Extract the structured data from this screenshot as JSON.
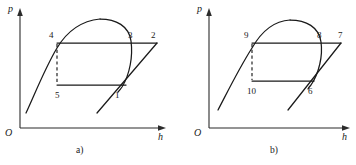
{
  "figure": {
    "type": "thermodynamic-cycle-p-h-diagram-pair",
    "background_color": "#ffffff",
    "line_color": "#1a1a1a",
    "axis_color": "#2b2b2b",
    "width": 356,
    "height": 165
  },
  "panels": [
    {
      "id": "a",
      "caption": "a)",
      "axes": {
        "y_label": "p",
        "x_label": "h",
        "origin_label": "O"
      },
      "points": [
        {
          "id": "4",
          "label": "4",
          "x": 57,
          "y": 43
        },
        {
          "id": "3",
          "label": "3",
          "x": 127,
          "y": 43
        },
        {
          "id": "2",
          "label": "2",
          "x": 157,
          "y": 43
        },
        {
          "id": "5",
          "label": "5",
          "x": 57,
          "y": 85
        },
        {
          "id": "1",
          "label": "1",
          "x": 122,
          "y": 85
        }
      ],
      "processes": [
        {
          "from": "4",
          "to": "2",
          "style": "solid",
          "kind": "isobar-condensation"
        },
        {
          "from": "5",
          "to": "1",
          "style": "solid",
          "kind": "isobar-evaporation"
        },
        {
          "from": "1",
          "to": "2",
          "style": "solid",
          "kind": "compression"
        },
        {
          "from": "4",
          "to": "5",
          "style": "dashed",
          "kind": "throttling"
        }
      ],
      "saturation_dome": {
        "apex_x": 100,
        "apex_y": 19,
        "left_foot_x": 26,
        "left_foot_y": 113,
        "right_foot_x": 118,
        "right_foot_y": 92
      }
    },
    {
      "id": "b",
      "caption": "b)",
      "axes": {
        "y_label": "p",
        "x_label": "h",
        "origin_label": "O"
      },
      "points": [
        {
          "id": "9",
          "label": "9",
          "x": 74,
          "y": 43
        },
        {
          "id": "8",
          "label": "8",
          "x": 138,
          "y": 43
        },
        {
          "id": "7",
          "label": "7",
          "x": 163,
          "y": 43
        },
        {
          "id": "10",
          "label": "10",
          "x": 74,
          "y": 81
        },
        {
          "id": "6",
          "label": "6",
          "x": 132,
          "y": 81
        }
      ],
      "processes": [
        {
          "from": "9",
          "to": "7",
          "style": "solid",
          "kind": "isobar-condensation"
        },
        {
          "from": "10",
          "to": "6",
          "style": "solid",
          "kind": "isobar-evaporation"
        },
        {
          "from": "6",
          "to": "7",
          "style": "solid",
          "kind": "compression"
        },
        {
          "from": "9",
          "to": "10",
          "style": "dashed",
          "kind": "throttling"
        }
      ],
      "saturation_dome": {
        "apex_x": 112,
        "apex_y": 20,
        "left_foot_x": 40,
        "left_foot_y": 110,
        "right_foot_x": 130,
        "right_foot_y": 89
      }
    }
  ]
}
